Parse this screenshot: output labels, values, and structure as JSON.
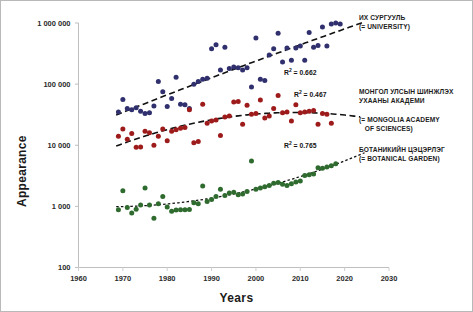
{
  "chart_data": {
    "type": "scatter",
    "title": "",
    "xlabel": "Years",
    "ylabel": "Appearance",
    "xlim": [
      1960,
      2030
    ],
    "ylim": [
      100,
      1000000
    ],
    "yscale": "log",
    "grid": false,
    "legend_position": "right-inline",
    "x_ticks": [
      "1960",
      "1970",
      "1980",
      "1990",
      "2000",
      "2010",
      "2020",
      "2030"
    ],
    "x_tick_values": [
      1960,
      1970,
      1980,
      1990,
      2000,
      2010,
      2020,
      2030
    ],
    "y_ticks": [
      "100",
      "1 000",
      "10 000",
      "100 000",
      "1 000 000"
    ],
    "y_tick_values": [
      100,
      1000,
      10000,
      100000,
      1000000
    ],
    "series": [
      {
        "name": "ИХ СУРГУУЛЬ (= UNIVERSITY)",
        "color": "#30306e",
        "r_squared": 0.662,
        "trend": "dashed-polynomial",
        "points": [
          [
            1969,
            35000
          ],
          [
            1970,
            56000
          ],
          [
            1971,
            40000
          ],
          [
            1972,
            38000
          ],
          [
            1973,
            41000
          ],
          [
            1974,
            36000
          ],
          [
            1975,
            33000
          ],
          [
            1976,
            34000
          ],
          [
            1977,
            44000
          ],
          [
            1978,
            110000
          ],
          [
            1979,
            75000
          ],
          [
            1980,
            43000
          ],
          [
            1981,
            58000
          ],
          [
            1982,
            130000
          ],
          [
            1983,
            47000
          ],
          [
            1984,
            46000
          ],
          [
            1985,
            40000
          ],
          [
            1986,
            100000
          ],
          [
            1987,
            110000
          ],
          [
            1988,
            120000
          ],
          [
            1989,
            125000
          ],
          [
            1990,
            380000
          ],
          [
            1991,
            440000
          ],
          [
            1992,
            170000
          ],
          [
            1993,
            400000
          ],
          [
            1994,
            180000
          ],
          [
            1995,
            190000
          ],
          [
            1996,
            185000
          ],
          [
            1997,
            170000
          ],
          [
            1998,
            185000
          ],
          [
            1999,
            90000
          ],
          [
            2000,
            570000
          ],
          [
            2001,
            120000
          ],
          [
            2002,
            115000
          ],
          [
            2003,
            300000
          ],
          [
            2004,
            380000
          ],
          [
            2005,
            680000
          ],
          [
            2006,
            230000
          ],
          [
            2007,
            390000
          ],
          [
            2008,
            245000
          ],
          [
            2009,
            390000
          ],
          [
            2010,
            420000
          ],
          [
            2011,
            245000
          ],
          [
            2012,
            700000
          ],
          [
            2013,
            400000
          ],
          [
            2014,
            430000
          ],
          [
            2015,
            860000
          ],
          [
            2016,
            420000
          ],
          [
            2017,
            960000
          ],
          [
            2018,
            1000000
          ],
          [
            2019,
            960000
          ]
        ]
      },
      {
        "name": "МОНГОЛ УЛСЫН ШИНЖЛЭХ УХААНЫ АКАДЕМИ (= MONGOLIA ACADEMY OF SCIENCES)",
        "color": "#9e1b1b",
        "r_squared": 0.467,
        "trend": "dashed-polynomial",
        "points": [
          [
            1969,
            14000
          ],
          [
            1970,
            18500
          ],
          [
            1971,
            12500
          ],
          [
            1972,
            15500
          ],
          [
            1973,
            9300
          ],
          [
            1974,
            9400
          ],
          [
            1975,
            17000
          ],
          [
            1976,
            16000
          ],
          [
            1977,
            10000
          ],
          [
            1978,
            14000
          ],
          [
            1979,
            18500
          ],
          [
            1980,
            11800
          ],
          [
            1981,
            17000
          ],
          [
            1982,
            18000
          ],
          [
            1983,
            19000
          ],
          [
            1984,
            19500
          ],
          [
            1985,
            38000
          ],
          [
            1986,
            11000
          ],
          [
            1987,
            11500
          ],
          [
            1988,
            47000
          ],
          [
            1989,
            23000
          ],
          [
            1990,
            25000
          ],
          [
            1991,
            26000
          ],
          [
            1992,
            14500
          ],
          [
            1993,
            29000
          ],
          [
            1994,
            30000
          ],
          [
            1995,
            51000
          ],
          [
            1996,
            52000
          ],
          [
            1997,
            22000
          ],
          [
            1998,
            45000
          ],
          [
            1999,
            32000
          ],
          [
            2000,
            33000
          ],
          [
            2001,
            55000
          ],
          [
            2002,
            28000
          ],
          [
            2003,
            30000
          ],
          [
            2004,
            40000
          ],
          [
            2005,
            65000
          ],
          [
            2006,
            34000
          ],
          [
            2007,
            35000
          ],
          [
            2008,
            25000
          ],
          [
            2009,
            46000
          ],
          [
            2010,
            34000
          ],
          [
            2011,
            35000
          ],
          [
            2012,
            36000
          ],
          [
            2013,
            37000
          ],
          [
            2014,
            22000
          ],
          [
            2015,
            33000
          ],
          [
            2016,
            32000
          ],
          [
            2017,
            23000
          ]
        ]
      },
      {
        "name": "БОТАНИКИЙН ЦЭЦЭРЛЭГ (= BOTANICAL GARDEN)",
        "color": "#2f6b2f",
        "r_squared": 0.765,
        "trend": "dotted-polynomial",
        "points": [
          [
            1969,
            880
          ],
          [
            1970,
            1800
          ],
          [
            1971,
            960
          ],
          [
            1972,
            780
          ],
          [
            1973,
            900
          ],
          [
            1974,
            1050
          ],
          [
            1975,
            2000
          ],
          [
            1976,
            1050
          ],
          [
            1977,
            640
          ],
          [
            1978,
            1100
          ],
          [
            1979,
            1450
          ],
          [
            1980,
            980
          ],
          [
            1981,
            830
          ],
          [
            1982,
            870
          ],
          [
            1983,
            880
          ],
          [
            1984,
            880
          ],
          [
            1985,
            890
          ],
          [
            1986,
            1150
          ],
          [
            1987,
            1100
          ],
          [
            1988,
            2150
          ],
          [
            1989,
            1200
          ],
          [
            1990,
            1300
          ],
          [
            1991,
            1450
          ],
          [
            1992,
            1900
          ],
          [
            1993,
            1500
          ],
          [
            1994,
            1650
          ],
          [
            1995,
            1700
          ],
          [
            1996,
            1550
          ],
          [
            1997,
            1600
          ],
          [
            1998,
            1750
          ],
          [
            1999,
            5500
          ],
          [
            2000,
            1900
          ],
          [
            2001,
            2000
          ],
          [
            2002,
            2100
          ],
          [
            2003,
            2200
          ],
          [
            2004,
            2400
          ],
          [
            2005,
            2450
          ],
          [
            2006,
            2300
          ],
          [
            2007,
            2200
          ],
          [
            2008,
            2350
          ],
          [
            2009,
            2500
          ],
          [
            2010,
            2600
          ],
          [
            2011,
            3200
          ],
          [
            2012,
            3300
          ],
          [
            2013,
            3400
          ],
          [
            2014,
            4300
          ],
          [
            2015,
            4200
          ],
          [
            2016,
            4400
          ],
          [
            2017,
            4600
          ],
          [
            2018,
            5000
          ]
        ]
      }
    ],
    "annotations": [
      {
        "text": "R² = 0.662",
        "series": "university"
      },
      {
        "text": "R² = 0.467",
        "series": "academy"
      },
      {
        "text": "R² = 0.765",
        "series": "botanical-garden"
      }
    ]
  },
  "axes": {
    "x_title": "Years",
    "y_title": "Appearance",
    "x_tick_labels": [
      "1960",
      "1970",
      "1980",
      "1990",
      "2000",
      "2010",
      "2020",
      "2030"
    ],
    "y_tick_labels": [
      "1 000 000",
      "100 000",
      "10 000",
      "1 000",
      "100"
    ]
  },
  "legend": {
    "university": {
      "line1": "ИХ СУРГУУЛЬ",
      "line2": "(= UNIVERSITY)"
    },
    "academy": {
      "line1": "МОНГОЛ УЛСЫН ШИНЖЛЭХ",
      "line2": "УХААНЫ АКАДЕМИ",
      "line3": "(= MONGOLIA ACADEMY",
      "line4": "   OF SCIENCES)"
    },
    "botanical": {
      "line1": "БОТАНИКИЙН ЦЭЦЭРЛЭГ",
      "line2": "(= BOTANICAL GARDEN)"
    }
  },
  "r2": {
    "university_prefix": "R",
    "university_sup": "2",
    "university_value": " = 0.662",
    "academy_value": " = 0.467",
    "botanical_value": " = 0.765"
  }
}
